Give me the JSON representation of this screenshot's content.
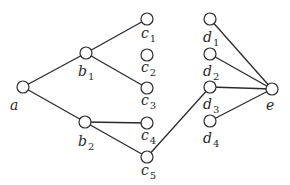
{
  "diagram": {
    "type": "graph",
    "node_radius": 6,
    "nodes": [
      {
        "id": "a",
        "name": "a",
        "sub": "",
        "x": 23,
        "y": 87,
        "lx": 10,
        "ly": 110
      },
      {
        "id": "b1",
        "name": "b",
        "sub": "1",
        "x": 86,
        "y": 53,
        "lx": 78,
        "ly": 76
      },
      {
        "id": "b2",
        "name": "b",
        "sub": "2",
        "x": 85,
        "y": 122,
        "lx": 78,
        "ly": 146
      },
      {
        "id": "c1",
        "name": "c",
        "sub": "1",
        "x": 147,
        "y": 19,
        "lx": 141,
        "ly": 38
      },
      {
        "id": "c2",
        "name": "c",
        "sub": "2",
        "x": 147,
        "y": 55,
        "lx": 141,
        "ly": 72
      },
      {
        "id": "c3",
        "name": "c",
        "sub": "3",
        "x": 147,
        "y": 88,
        "lx": 141,
        "ly": 105
      },
      {
        "id": "c4",
        "name": "c",
        "sub": "4",
        "x": 147,
        "y": 123,
        "lx": 141,
        "ly": 140
      },
      {
        "id": "c5",
        "name": "c",
        "sub": "5",
        "x": 147,
        "y": 157,
        "lx": 141,
        "ly": 175
      },
      {
        "id": "d1",
        "name": "d",
        "sub": "1",
        "x": 210,
        "y": 19,
        "lx": 203,
        "ly": 42
      },
      {
        "id": "d2",
        "name": "d",
        "sub": "2",
        "x": 210,
        "y": 54,
        "lx": 203,
        "ly": 76
      },
      {
        "id": "d3",
        "name": "d",
        "sub": "3",
        "x": 210,
        "y": 87,
        "lx": 203,
        "ly": 109
      },
      {
        "id": "d4",
        "name": "d",
        "sub": "4",
        "x": 210,
        "y": 121,
        "lx": 203,
        "ly": 143
      },
      {
        "id": "e",
        "name": "e",
        "sub": "",
        "x": 272,
        "y": 89,
        "lx": 266,
        "ly": 110
      }
    ],
    "edges": [
      [
        "a",
        "b1"
      ],
      [
        "a",
        "b2"
      ],
      [
        "b1",
        "c1"
      ],
      [
        "b1",
        "c3"
      ],
      [
        "b2",
        "c4"
      ],
      [
        "b2",
        "c5"
      ],
      [
        "c5",
        "d3"
      ],
      [
        "d1",
        "e"
      ],
      [
        "d2",
        "e"
      ],
      [
        "d3",
        "e"
      ],
      [
        "d4",
        "e"
      ]
    ]
  }
}
